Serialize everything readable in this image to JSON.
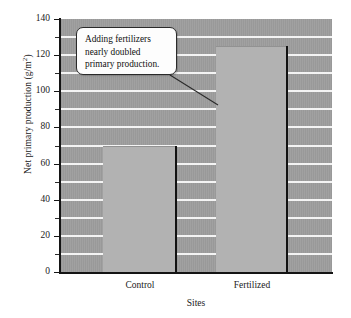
{
  "chart_data": {
    "type": "bar",
    "title": "",
    "subtitle": "",
    "xlabel": "Sites",
    "ylabel": "Net primary production (g/m2)",
    "ylabel_main": "Net primary production (g/m",
    "ylabel_exponent": "2",
    "ylabel_close": ")",
    "categories": [
      "Control",
      "Fertilized"
    ],
    "values": [
      70,
      125
    ],
    "series": [
      {
        "name": "Net primary production",
        "values": [
          70,
          125
        ]
      }
    ],
    "ylim": [
      0,
      140
    ],
    "ytick_major": [
      0,
      20,
      40,
      60,
      80,
      100,
      120,
      140
    ],
    "ytick_major_labels": [
      "0",
      "20",
      "40",
      "60",
      "80",
      "100",
      "120",
      "140"
    ],
    "ytick_minor": [
      10,
      30,
      50,
      70,
      90,
      110,
      130
    ],
    "gridlines": [
      10,
      20,
      30,
      40,
      50,
      60,
      70,
      80,
      90,
      100,
      110,
      120,
      130
    ],
    "grid": true,
    "grid_color": "#f4f4f4",
    "plot_background": "#9e9e9e",
    "bar_color": "#b2b2b2",
    "bar_edge_color": "#121212",
    "axis_color": "#141414",
    "legend": null,
    "legend_position": "none",
    "annotations": [
      {
        "name": "callout",
        "text": "Adding fertilizers nearly doubled primary production.",
        "lines": [
          "Adding fertilizers",
          "nearly doubled",
          "primary production."
        ],
        "points_to": "Fertilized"
      }
    ]
  }
}
